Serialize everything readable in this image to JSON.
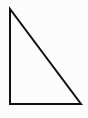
{
  "figure": {
    "shape_name": "right-triangle",
    "background_color": "#fcfcfc",
    "canvas": {
      "width": 88,
      "height": 118
    },
    "stroke": {
      "color": "#111111",
      "width": 2,
      "linejoin": "miter",
      "linecap": "butt"
    },
    "fill": "none",
    "vertices": [
      {
        "name": "apex-top-left",
        "x": 10,
        "y": 9
      },
      {
        "name": "right-angle-bottom-left",
        "x": 10,
        "y": 104
      },
      {
        "name": "bottom-right",
        "x": 81,
        "y": 104
      }
    ],
    "edges": [
      {
        "name": "vertical-leg",
        "from": "apex-top-left",
        "to": "right-angle-bottom-left"
      },
      {
        "name": "horizontal-leg",
        "from": "right-angle-bottom-left",
        "to": "bottom-right"
      },
      {
        "name": "hypotenuse",
        "from": "bottom-right",
        "to": "apex-top-left"
      }
    ],
    "polygon_points": "10,9 10,104 81,104",
    "labels": []
  }
}
